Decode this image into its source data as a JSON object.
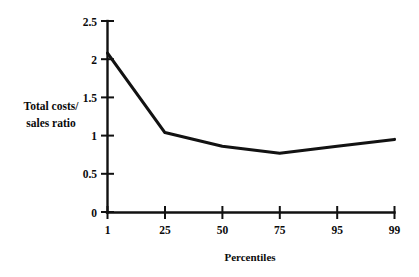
{
  "chart_data": {
    "type": "line",
    "title": "",
    "xlabel": "Percentiles",
    "ylabel": "Total costs/ sales ratio",
    "ylabel_lines": [
      "Total costs/",
      "sales ratio"
    ],
    "categories": [
      "1",
      "25",
      "50",
      "75",
      "95",
      "99"
    ],
    "values": [
      2.08,
      1.04,
      0.86,
      0.77,
      0.86,
      0.95
    ],
    "series": [
      {
        "name": "Total costs/sales ratio",
        "values": [
          2.08,
          1.04,
          0.86,
          0.77,
          0.86,
          0.95
        ],
        "color": "#121212"
      }
    ],
    "x_tick_labels": [
      "1",
      "25",
      "50",
      "75",
      "95",
      "99"
    ],
    "y_tick_labels": [
      "0",
      "0.5",
      "1",
      "1.5",
      "2",
      "2.5"
    ],
    "y_tick_values": [
      0,
      0.5,
      1,
      1.5,
      2,
      2.5
    ],
    "ylim": [
      0,
      2.5
    ],
    "grid": false,
    "legend": false,
    "legend_position": "none",
    "line_color": "#121212",
    "axis_color": "#111111",
    "background_color": "#ffffff"
  },
  "axis": {
    "x_title": "Percentiles",
    "y_title_line1": "Total costs/",
    "y_title_line2": "sales ratio",
    "y_ticks": [
      {
        "label": "2.5",
        "value": 2.5
      },
      {
        "label": "2",
        "value": 2
      },
      {
        "label": "1.5",
        "value": 1.5
      },
      {
        "label": "1",
        "value": 1
      },
      {
        "label": "0.5",
        "value": 0.5
      },
      {
        "label": "0",
        "value": 0
      }
    ],
    "x_ticks": [
      {
        "label": "1"
      },
      {
        "label": "25"
      },
      {
        "label": "50"
      },
      {
        "label": "75"
      },
      {
        "label": "95"
      },
      {
        "label": "99"
      }
    ]
  }
}
